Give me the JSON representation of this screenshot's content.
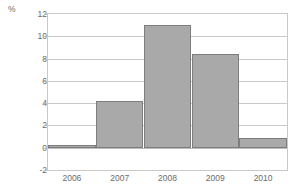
{
  "chart_data": {
    "type": "bar",
    "title": "",
    "subtitle": "",
    "xlabel": "",
    "ylabel": "%",
    "unit_label": "%",
    "categories": [
      "2006",
      "2007",
      "2008",
      "2009",
      "2010"
    ],
    "values": [
      0.25,
      4.2,
      11.0,
      8.4,
      0.9
    ],
    "series": [
      {
        "name": "",
        "values": [
          0.25,
          4.2,
          11.0,
          8.4,
          0.9
        ]
      }
    ],
    "ylim": [
      -2,
      12
    ],
    "yticks": [
      12,
      10,
      8,
      6,
      4,
      2,
      0,
      -2
    ],
    "ytick_labels": [
      "12",
      "10",
      "8",
      "6",
      "4",
      "2",
      "0",
      "-2"
    ],
    "grid": true,
    "grid_axis": "y",
    "legend": false,
    "legend_position": "none",
    "bar_fill_color": "#a9a9a9",
    "bar_edge_color": "#7d7d7d",
    "grid_color": "#c9c9c9",
    "axis_color": "#c9c9c9",
    "text_color": "#6b6b6b",
    "background_color": "#ffffff"
  }
}
